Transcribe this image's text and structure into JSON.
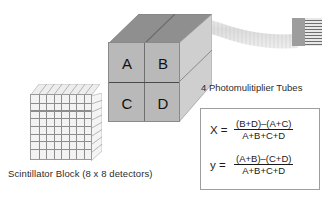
{
  "diagram": {
    "scintillator": {
      "caption": "Scintillator Block (8 x 8 detectors)",
      "rows": 8,
      "cols": 8,
      "icon": "grid-cube-icon"
    },
    "detector_block": {
      "icon": "3d-block-icon",
      "quadrants": [
        {
          "id": "A",
          "label": "A",
          "position": "top-left"
        },
        {
          "id": "B",
          "label": "B",
          "position": "top-right"
        },
        {
          "id": "C",
          "label": "C",
          "position": "bottom-left"
        },
        {
          "id": "D",
          "label": "D",
          "position": "bottom-right"
        }
      ]
    },
    "light_guide": {
      "icon": "curved-ribbon-icon"
    },
    "pmt": {
      "label": "4 Photomulitiplier Tubes",
      "icon": "pmt-connector-icon",
      "stripe_count": 9
    },
    "formulas": {
      "x": {
        "lhs": "X =",
        "numerator": "(B+D)–(A+C)",
        "denominator": "A+B+C+D"
      },
      "y": {
        "lhs": "y =",
        "numerator": "(A+B)–(C+D)",
        "denominator": "A+B+C+D"
      }
    }
  },
  "colors": {
    "block_front": "#b9b9b9",
    "block_top": "#8f8f8f",
    "block_side": "#cfcfcf",
    "grid_line": "#8d8d8d",
    "ribbon": "#e3e3e3",
    "pmt_body": "#9d9d9d",
    "box_border": "#9e9e9e",
    "text": "#2b2b2b",
    "background": "#ffffff"
  }
}
